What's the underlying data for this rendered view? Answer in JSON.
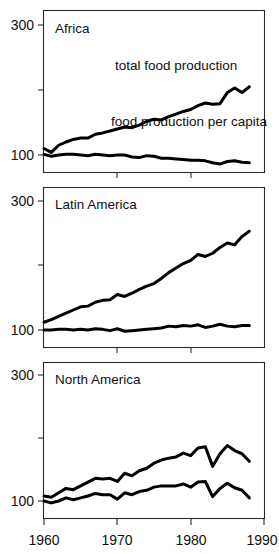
{
  "chart_data": {
    "type": "line",
    "title": "",
    "subtitle": "",
    "xlabel": "",
    "ylabel": "",
    "xlim": [
      1960,
      1990
    ],
    "ylim": [
      80,
      310
    ],
    "grid": false,
    "legend_position": "inline-annotations",
    "x_ticks": [
      1960,
      1970,
      1980,
      1990
    ],
    "x_tick_labels": [
      "1960",
      "1970",
      "1980",
      "1990"
    ],
    "y_ticks": [
      100,
      200,
      300
    ],
    "y_tick_labels": [
      "100",
      "",
      "300"
    ],
    "index_note": "Index values, 1960 = 100",
    "panels": [
      {
        "name": "Africa",
        "title": "Africa",
        "x": [
          1960,
          1961,
          1962,
          1963,
          1964,
          1965,
          1966,
          1967,
          1968,
          1969,
          1970,
          1971,
          1972,
          1973,
          1974,
          1975,
          1976,
          1977,
          1978,
          1979,
          1980,
          1981,
          1982,
          1983,
          1984,
          1985,
          1986,
          1987,
          1988
        ],
        "series": [
          {
            "name": "total food production",
            "label": "total food production",
            "label_x": 1976,
            "label_y": 252,
            "values": [
              110,
              104,
              115,
              120,
              124,
              126,
              126,
              132,
              134,
              137,
              140,
              143,
              142,
              146,
              152,
              155,
              154,
              159,
              163,
              167,
              170,
              176,
              180,
              178,
              179,
              196,
              203,
              196,
              205
            ]
          },
          {
            "name": "food production per capita",
            "label": "food production per capita",
            "label_x": 1975,
            "label_y": 131,
            "values": [
              101,
              98,
              100,
              101,
              101,
              100,
              99,
              101,
              100,
              99,
              100,
              100,
              97,
              96,
              99,
              98,
              95,
              95,
              94,
              93,
              92,
              92,
              91,
              88,
              86,
              90,
              91,
              89,
              88
            ]
          }
        ]
      },
      {
        "name": "Latin America",
        "title": "Latin America",
        "x": [
          1960,
          1961,
          1962,
          1963,
          1964,
          1965,
          1966,
          1967,
          1968,
          1969,
          1970,
          1971,
          1972,
          1973,
          1974,
          1975,
          1976,
          1977,
          1978,
          1979,
          1980,
          1981,
          1982,
          1983,
          1984,
          1985,
          1986,
          1987,
          1988
        ],
        "series": [
          {
            "name": "total food production",
            "label": "",
            "values": [
              112,
              116,
              121,
              126,
              131,
              136,
              137,
              143,
              146,
              147,
              155,
              152,
              157,
              163,
              168,
              172,
              180,
              189,
              196,
              203,
              208,
              217,
              214,
              219,
              228,
              235,
              232,
              245,
              253
            ]
          },
          {
            "name": "food production per capita",
            "label": "",
            "values": [
              100,
              100,
              101,
              101,
              100,
              101,
              100,
              102,
              101,
              99,
              102,
              98,
              99,
              100,
              101,
              102,
              103,
              106,
              105,
              107,
              106,
              108,
              104,
              106,
              109,
              106,
              105,
              107,
              107
            ]
          }
        ]
      },
      {
        "name": "North America",
        "title": "North America",
        "x": [
          1960,
          1961,
          1962,
          1963,
          1964,
          1965,
          1966,
          1967,
          1968,
          1969,
          1970,
          1971,
          1972,
          1973,
          1974,
          1975,
          1976,
          1977,
          1978,
          1979,
          1980,
          1981,
          1982,
          1983,
          1984,
          1985,
          1986,
          1987,
          1988
        ],
        "series": [
          {
            "name": "total food production",
            "label": "",
            "values": [
              108,
              106,
              113,
              120,
              118,
              124,
              130,
              136,
              135,
              136,
              131,
              144,
              140,
              148,
              152,
              160,
              165,
              168,
              170,
              176,
              172,
              184,
              186,
              155,
              175,
              188,
              180,
              175,
              163
            ]
          },
          {
            "name": "food production per capita",
            "label": "",
            "values": [
              100,
              97,
              100,
              105,
              102,
              105,
              108,
              112,
              110,
              110,
              103,
              113,
              110,
              115,
              117,
              122,
              124,
              124,
              124,
              127,
              122,
              130,
              131,
              107,
              120,
              128,
              121,
              117,
              105
            ]
          }
        ]
      }
    ]
  },
  "panel_titles": {
    "africa": "Africa",
    "latin_america": "Latin America",
    "north_america": "North America"
  },
  "annotations": {
    "total_food_production": "total food production",
    "food_production_per_capita": "food production per capita"
  },
  "axis": {
    "y_top_label": "300",
    "y_bottom_label": "100",
    "x_label_1": "1960",
    "x_label_2": "1970",
    "x_label_3": "1980",
    "x_label_4": "1990"
  },
  "colors": {
    "line": "#000000",
    "axis": "#2b2b2b",
    "background": "#ffffff",
    "text": "#111111"
  }
}
